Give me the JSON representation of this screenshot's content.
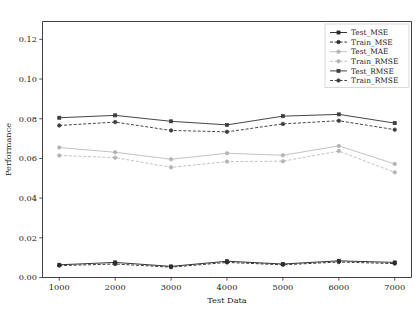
{
  "chart_data": {
    "type": "line",
    "title": "",
    "xlabel": "Test Data",
    "ylabel": "Performance",
    "x": [
      1000,
      2000,
      3000,
      4000,
      5000,
      6000,
      7000
    ],
    "xtick_labels": [
      "1000",
      "2000",
      "3000",
      "4000",
      "5000",
      "6000",
      "7000"
    ],
    "ytick_labels": [
      "0.00",
      "0.02",
      "0.04",
      "0.06",
      "0.08",
      "0.10",
      "0.12"
    ],
    "yticks": [
      0.0,
      0.02,
      0.04,
      0.06,
      0.08,
      0.1,
      0.12
    ],
    "ylim": [
      0.0,
      0.129
    ],
    "xlim": [
      700,
      7300
    ],
    "grid": false,
    "legend_position": "upper right",
    "series": [
      {
        "name": "Test_MSE",
        "values": [
          0.0064,
          0.0076,
          0.0056,
          0.0082,
          0.0068,
          0.0084,
          0.0076
        ],
        "color": "#2b2b2b",
        "linestyle": "solid",
        "marker": "square"
      },
      {
        "name": "Train_MSE",
        "values": [
          0.006,
          0.0068,
          0.0052,
          0.0076,
          0.0064,
          0.0078,
          0.007
        ],
        "color": "#2b2b2b",
        "linestyle": "dashed",
        "marker": "circle"
      },
      {
        "name": "Test_MAE",
        "values": [
          0.0655,
          0.0631,
          0.0596,
          0.0626,
          0.0616,
          0.0663,
          0.0572
        ],
        "color": "#b3b3b3",
        "linestyle": "solid",
        "marker": "circle"
      },
      {
        "name": "Train_RMSE",
        "values": [
          0.0615,
          0.0604,
          0.0555,
          0.0584,
          0.0586,
          0.0637,
          0.053
        ],
        "color": "#b3b3b3",
        "linestyle": "dashed",
        "marker": "circle"
      },
      {
        "name": "Test_RMSE",
        "values": [
          0.0805,
          0.0817,
          0.0787,
          0.0769,
          0.0813,
          0.0822,
          0.0778
        ],
        "color": "#3c3c3c",
        "linestyle": "solid",
        "marker": "square"
      },
      {
        "name": "Train_RMSE",
        "values": [
          0.0766,
          0.0783,
          0.0741,
          0.0734,
          0.0774,
          0.079,
          0.0745
        ],
        "color": "#3c3c3c",
        "linestyle": "dashed",
        "marker": "circle"
      }
    ]
  },
  "legend": {
    "items": [
      {
        "label": "Test_MSE"
      },
      {
        "label": "Train_MSE"
      },
      {
        "label": "Test_MAE"
      },
      {
        "label": "Train_RMSE"
      },
      {
        "label": "Test_RMSE"
      },
      {
        "label": "Train_RMSE"
      }
    ]
  },
  "colors": {
    "dark": "#2b2b2b",
    "mid": "#3c3c3c",
    "light": "#b3b3b3",
    "axis": "#2b2b2b",
    "background": "#ffffff"
  }
}
